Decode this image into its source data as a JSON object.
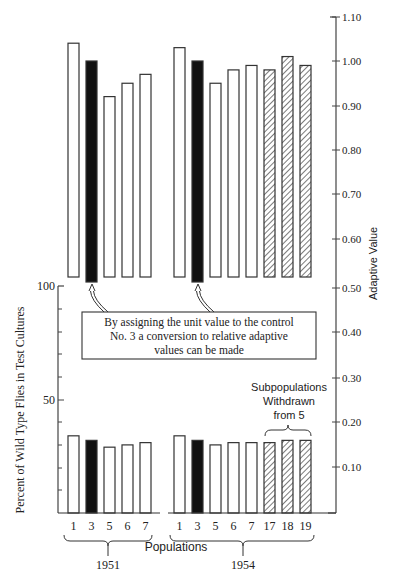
{
  "chart_data": [
    {
      "type": "bar",
      "title": "Adaptive Value",
      "ylabel": "Adaptive Value",
      "ylim": [
        0.5,
        1.1
      ],
      "yticks": [
        "1.10",
        "1.00",
        "0.90",
        "0.80",
        "0.70",
        "0.60",
        "0.50"
      ],
      "categories": [
        "1951-1",
        "1951-3",
        "1951-5",
        "1951-6",
        "1951-7",
        "1954-1",
        "1954-3",
        "1954-5",
        "1954-6",
        "1954-7",
        "1954-17",
        "1954-18",
        "1954-19"
      ],
      "values": [
        1.04,
        1.0,
        0.92,
        0.95,
        0.97,
        1.03,
        1.0,
        0.95,
        0.98,
        0.99,
        0.98,
        1.01,
        0.99
      ],
      "styles": [
        "open",
        "solid",
        "open",
        "open",
        "open",
        "open",
        "solid",
        "open",
        "open",
        "open",
        "hatched",
        "hatched",
        "hatched"
      ]
    },
    {
      "type": "bar",
      "title": "Percent of Wild Type Flies in Test Cultures",
      "ylabel": "Percent of Wild Type Flies in Test Cultures",
      "ylim": [
        0,
        100
      ],
      "yticks_left": [
        "100",
        "50"
      ],
      "right_axis_ticks": [
        "0.40",
        "0.30",
        "0.20",
        "0.10"
      ],
      "xlabel": "Populations",
      "categories": [
        "1951-1",
        "1951-3",
        "1951-5",
        "1951-6",
        "1951-7",
        "1954-1",
        "1954-3",
        "1954-5",
        "1954-6",
        "1954-7",
        "1954-17",
        "1954-18",
        "1954-19"
      ],
      "values": [
        34,
        32,
        29,
        30,
        31,
        34,
        32,
        30,
        31,
        31,
        31,
        32,
        32
      ],
      "styles": [
        "open",
        "solid",
        "open",
        "open",
        "open",
        "open",
        "solid",
        "open",
        "open",
        "open",
        "hatched",
        "hatched",
        "hatched"
      ]
    }
  ],
  "labels": {
    "right_axis_title": "Adaptive Value",
    "left_axis_title": "Percent of Wild Type Flies in Test Cultures",
    "x_axis_title": "Populations",
    "right_ticks": [
      "1.10",
      "1.00",
      "0.90",
      "0.80",
      "0.70",
      "0.60",
      "0.50",
      "0.40",
      "0.30",
      "0.20",
      "0.10"
    ],
    "left_ticks": [
      "100",
      "50"
    ],
    "group_1951": {
      "year": "1951",
      "pops": [
        "1",
        "3",
        "5",
        "6",
        "7"
      ]
    },
    "group_1954": {
      "year": "1954",
      "pops": [
        "1",
        "3",
        "5",
        "6",
        "7",
        "17",
        "18",
        "19"
      ]
    },
    "annotation": {
      "line1": "By assigning the unit value to the control",
      "line2": "No. 3 a conversion to relative adaptive",
      "line3": "values can be made"
    },
    "subpop": {
      "line1": "Subpopulations",
      "line2": "Withdrawn",
      "line3": "from 5"
    }
  }
}
